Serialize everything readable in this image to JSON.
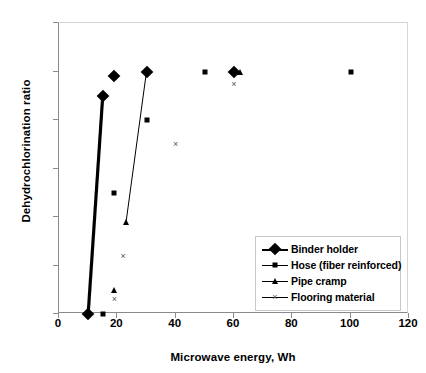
{
  "chart_data": {
    "type": "scatter",
    "title": "",
    "xlabel": "Microwave energy, Wh",
    "ylabel": "Dehydrochlorination ratio",
    "xlim": [
      0,
      120
    ],
    "ylim": [
      0,
      1.2
    ],
    "xticks": [
      0,
      20,
      40,
      60,
      80,
      100,
      120
    ],
    "yticks": [
      0,
      0.2,
      0.4,
      0.6,
      0.8,
      1,
      1.2
    ],
    "xtick_labels": [
      "0",
      "20",
      "40",
      "60",
      "80",
      "100",
      "120"
    ],
    "ytick_labels": [
      "0",
      "0.2",
      "0.4",
      "0.6",
      "0.8",
      "1",
      "1.2"
    ],
    "grid": false,
    "legend_position": "inside-lower-right",
    "series": [
      {
        "name": "Binder holder",
        "marker": "diamond",
        "line": "thick",
        "points": [
          {
            "x": 10,
            "y": 0.0
          },
          {
            "x": 15,
            "y": 0.9
          }
        ],
        "extra_points": [
          {
            "x": 19,
            "y": 0.98
          },
          {
            "x": 30,
            "y": 1.0
          },
          {
            "x": 60,
            "y": 1.0
          }
        ]
      },
      {
        "name": "Hose (fiber reinforced)",
        "marker": "square",
        "line": "none",
        "points": [
          {
            "x": 15,
            "y": 0.0
          },
          {
            "x": 19,
            "y": 0.5
          },
          {
            "x": 30,
            "y": 0.8
          },
          {
            "x": 50,
            "y": 1.0
          },
          {
            "x": 100,
            "y": 1.0
          }
        ]
      },
      {
        "name": "Pipe cramp",
        "marker": "triangle",
        "line": "thin",
        "points": [
          {
            "x": 23,
            "y": 0.38
          },
          {
            "x": 30,
            "y": 1.0
          }
        ],
        "extra_points": [
          {
            "x": 19,
            "y": 0.1
          },
          {
            "x": 62,
            "y": 1.0
          }
        ]
      },
      {
        "name": "Flooring material",
        "marker": "cross",
        "line": "none",
        "points": [
          {
            "x": 19,
            "y": 0.06
          },
          {
            "x": 22,
            "y": 0.24
          },
          {
            "x": 40,
            "y": 0.7
          },
          {
            "x": 60,
            "y": 0.95
          }
        ]
      }
    ]
  },
  "legend": {
    "items": [
      {
        "label": "Binder holder",
        "marker": "diamond",
        "line": "thick"
      },
      {
        "label": "Hose (fiber reinforced)",
        "marker": "square",
        "line": "thin"
      },
      {
        "label": "Pipe cramp",
        "marker": "triangle",
        "line": "thin"
      },
      {
        "label": "Flooring material",
        "marker": "cross",
        "line": "thin"
      }
    ]
  },
  "colors": {
    "series": "#000000",
    "axis": "#8a8a8a",
    "frame_light": "#d6d6d6",
    "cross_marker": "#555555",
    "background": "#ffffff"
  }
}
